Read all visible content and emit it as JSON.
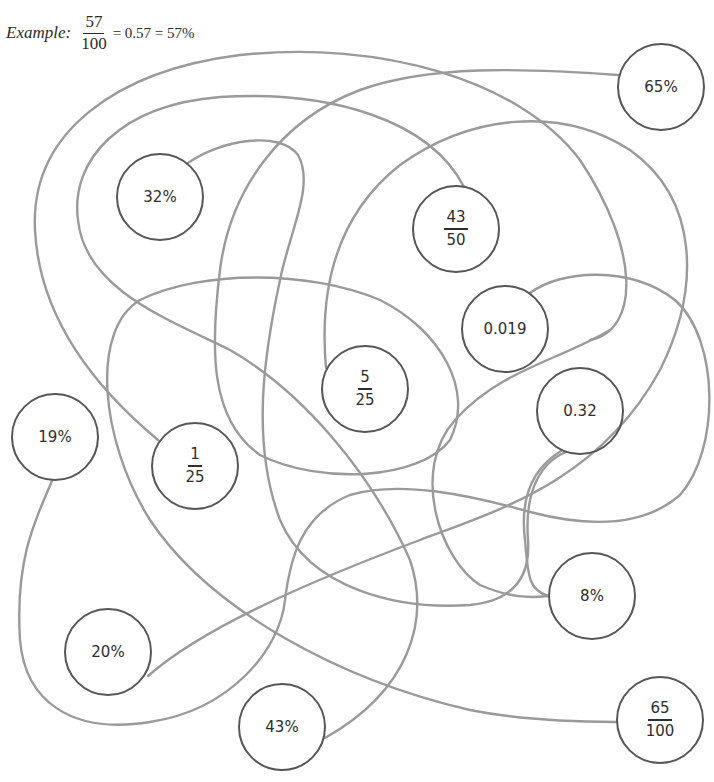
{
  "example": {
    "label": "Example:",
    "numerator": "57",
    "denominator": "100",
    "equivalents": "= 0.57 = 57%"
  },
  "colors": {
    "circle_stroke": "#565656",
    "line_stroke": "#9a9a9a",
    "text": "#2e2e2e",
    "background": "#ffffff"
  },
  "nodes": [
    {
      "id": "n-32pct",
      "type": "text",
      "label": "32%",
      "x": 160,
      "y": 197
    },
    {
      "id": "n-43-50",
      "type": "fraction",
      "numerator": "43",
      "denominator": "50",
      "x": 456,
      "y": 229
    },
    {
      "id": "n-65pct",
      "type": "text",
      "label": "65%",
      "x": 661,
      "y": 87
    },
    {
      "id": "n-0019",
      "type": "text",
      "label": "0.019",
      "x": 505,
      "y": 329
    },
    {
      "id": "n-5-25",
      "type": "fraction",
      "numerator": "5",
      "denominator": "25",
      "x": 365,
      "y": 389
    },
    {
      "id": "n-032",
      "type": "text",
      "label": "0.32",
      "x": 580,
      "y": 411
    },
    {
      "id": "n-19pct",
      "type": "text",
      "label": "19%",
      "x": 55,
      "y": 437
    },
    {
      "id": "n-1-25",
      "type": "fraction",
      "numerator": "1",
      "denominator": "25",
      "x": 195,
      "y": 466
    },
    {
      "id": "n-8pct",
      "type": "text",
      "label": "8%",
      "x": 592,
      "y": 596
    },
    {
      "id": "n-20pct",
      "type": "text",
      "label": "20%",
      "x": 108,
      "y": 652
    },
    {
      "id": "n-65-100",
      "type": "fraction",
      "numerator": "65",
      "denominator": "100",
      "x": 660,
      "y": 720
    },
    {
      "id": "n-43pct",
      "type": "text",
      "label": "43%",
      "x": 282,
      "y": 727
    }
  ],
  "connections": [
    {
      "from": "32%",
      "to": "8%"
    },
    {
      "from": "43/50",
      "to": "65/100"
    },
    {
      "from": "65%",
      "to": "5/25"
    },
    {
      "from": "0.019",
      "to": "1/25"
    },
    {
      "from": "0.32",
      "to": "43%"
    },
    {
      "from": "19%",
      "to": "20%"
    },
    {
      "from": "1/25",
      "to": "43/50"
    },
    {
      "from": "20%",
      "to": "0.019"
    }
  ]
}
